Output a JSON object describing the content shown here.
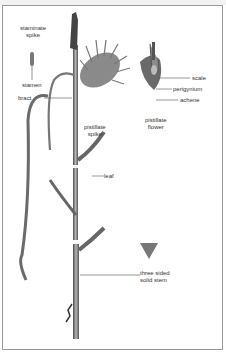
{
  "diagram": {
    "labels": {
      "staminate_spike_1": "staminate",
      "staminate_spike_2": "spike",
      "stamen": "stamen",
      "bract": "bract",
      "pistillate_spike_1": "pistillate",
      "pistillate_spike_2": "spike",
      "scale": "scale",
      "perigynium": "perigynium",
      "achene": "achene",
      "pistillate_flower_1": "pistillate",
      "pistillate_flower_2": "flower",
      "leaf": "leaf",
      "stem_1": "three sided",
      "stem_2": "solid stem"
    },
    "colors": {
      "ink": "#333333",
      "stem_dark": "#5a5a5a",
      "stem_light": "#9a9a9a",
      "frame": "#9a9a9a"
    }
  }
}
